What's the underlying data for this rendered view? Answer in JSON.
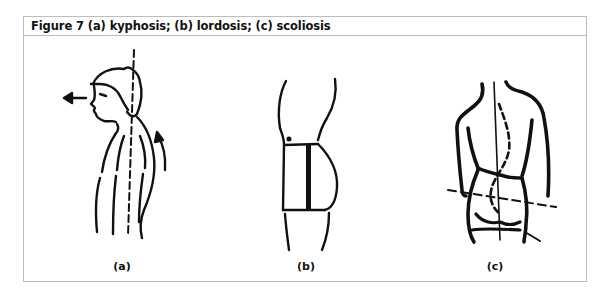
{
  "figure": {
    "title": "Figure 7 (a) kyphosis; (b) lordosis; (c) scoliosis",
    "panels": [
      {
        "label": "(a)",
        "depicts": "kyphosis"
      },
      {
        "label": "(b)",
        "depicts": "lordosis"
      },
      {
        "label": "(c)",
        "depicts": "scoliosis"
      }
    ],
    "colors": {
      "border": "#bdbdbd",
      "ink": "#111111",
      "background": "#ffffff"
    }
  }
}
